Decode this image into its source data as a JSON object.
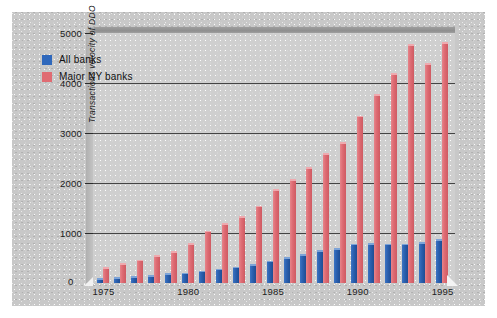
{
  "chart_data": {
    "type": "bar",
    "title": "",
    "xlabel": "",
    "ylabel": "Transactions velocity of DDO",
    "ylim": [
      0,
      5000
    ],
    "ytick_labels": [
      "0",
      "1000",
      "2000",
      "3000",
      "4000",
      "5000"
    ],
    "ytick_values": [
      0,
      1000,
      2000,
      3000,
      4000,
      5000
    ],
    "grid": true,
    "legend_position": "upper left inside plot",
    "categories": [
      1975,
      1976,
      1977,
      1978,
      1979,
      1980,
      1981,
      1982,
      1983,
      1984,
      1985,
      1986,
      1987,
      1988,
      1989,
      1990,
      1991,
      1992,
      1993,
      1994,
      1995
    ],
    "xtick_labels": [
      "1975",
      "1980",
      "1985",
      "1990",
      "1995"
    ],
    "xtick_values": [
      1975,
      1980,
      1985,
      1990,
      1995
    ],
    "series": [
      {
        "name": "All banks",
        "color": "#2f68bc",
        "values": [
          100,
          120,
          140,
          160,
          200,
          210,
          250,
          290,
          330,
          380,
          450,
          520,
          580,
          660,
          700,
          790,
          800,
          790,
          790,
          820,
          880
        ]
      },
      {
        "name": "Major NY banks",
        "color": "#e06b72",
        "values": [
          320,
          400,
          470,
          560,
          640,
          800,
          1050,
          1200,
          1340,
          1550,
          1880,
          2080,
          2320,
          2600,
          2820,
          3350,
          3780,
          4200,
          4780,
          4400,
          4820
        ]
      }
    ]
  },
  "legend": {
    "items": [
      {
        "label": "All banks",
        "color": "#2f68bc"
      },
      {
        "label": "Major NY banks",
        "color": "#e06b72"
      }
    ]
  }
}
